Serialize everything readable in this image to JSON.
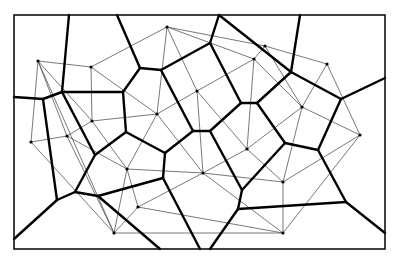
{
  "diagram": {
    "type": "voronoi-delaunay",
    "size": {
      "width": 397,
      "height": 260
    },
    "colors": {
      "background": "#ffffff",
      "frame": "#111111",
      "voronoi": "#000000",
      "delaunay": "#555555",
      "site": "#000000"
    },
    "stroke_widths": {
      "frame": 1.6,
      "voronoi": 2.4,
      "delaunay": 0.8
    },
    "frame": {
      "x": 14,
      "y": 15,
      "w": 371,
      "h": 234
    },
    "sites": [
      [
        38,
        61
      ],
      [
        91,
        67
      ],
      [
        167,
        27
      ],
      [
        197,
        91
      ],
      [
        157,
        114
      ],
      [
        92,
        121
      ],
      [
        31,
        142
      ],
      [
        67,
        136
      ],
      [
        127,
        169
      ],
      [
        138,
        207
      ],
      [
        114,
        233
      ],
      [
        203,
        173
      ],
      [
        247,
        149
      ],
      [
        283,
        182
      ],
      [
        283,
        233
      ],
      [
        360,
        135
      ],
      [
        302,
        107
      ],
      [
        327,
        64
      ],
      [
        265,
        46
      ],
      [
        254,
        59
      ]
    ],
    "delaunay_edges": [
      [
        0,
        6
      ],
      [
        0,
        7
      ],
      [
        6,
        7
      ],
      [
        0,
        1
      ],
      [
        1,
        5
      ],
      [
        5,
        7
      ],
      [
        1,
        4
      ],
      [
        4,
        5
      ],
      [
        1,
        2
      ],
      [
        2,
        4
      ],
      [
        2,
        3
      ],
      [
        2,
        19
      ],
      [
        3,
        19
      ],
      [
        3,
        4
      ],
      [
        3,
        11
      ],
      [
        4,
        11
      ],
      [
        3,
        12
      ],
      [
        11,
        12
      ],
      [
        12,
        19
      ],
      [
        16,
        19
      ],
      [
        18,
        19
      ],
      [
        17,
        18
      ],
      [
        16,
        17
      ],
      [
        15,
        17
      ],
      [
        15,
        16
      ],
      [
        12,
        16
      ],
      [
        13,
        16
      ],
      [
        12,
        13
      ],
      [
        13,
        15
      ],
      [
        14,
        15
      ],
      [
        13,
        14
      ],
      [
        11,
        13
      ],
      [
        11,
        14
      ],
      [
        8,
        11
      ],
      [
        4,
        8
      ],
      [
        5,
        8
      ],
      [
        8,
        9
      ],
      [
        9,
        11
      ],
      [
        9,
        10
      ],
      [
        8,
        10
      ],
      [
        7,
        10
      ],
      [
        6,
        10
      ],
      [
        2,
        18
      ],
      [
        0,
        5
      ],
      [
        0,
        10
      ],
      [
        7,
        8
      ],
      [
        10,
        14
      ],
      [
        16,
        18
      ],
      [
        9,
        14
      ]
    ],
    "voronoi_edges": [
      [
        14,
        97,
        43,
        99
      ],
      [
        43,
        99,
        62,
        92
      ],
      [
        43,
        99,
        57,
        200
      ],
      [
        62,
        92,
        69,
        15
      ],
      [
        62,
        92,
        123,
        92
      ],
      [
        62,
        92,
        95,
        155
      ],
      [
        123,
        92,
        140,
        68
      ],
      [
        123,
        92,
        126,
        132
      ],
      [
        140,
        68,
        117,
        15
      ],
      [
        140,
        68,
        161,
        70
      ],
      [
        161,
        70,
        210,
        43
      ],
      [
        210,
        43,
        219,
        15
      ],
      [
        210,
        43,
        241,
        103
      ],
      [
        161,
        70,
        193,
        131
      ],
      [
        193,
        131,
        210,
        131
      ],
      [
        193,
        131,
        165,
        153
      ],
      [
        210,
        131,
        241,
        103
      ],
      [
        210,
        131,
        242,
        190
      ],
      [
        241,
        103,
        257,
        103
      ],
      [
        257,
        103,
        291,
        72
      ],
      [
        219,
        15,
        291,
        72
      ],
      [
        291,
        72,
        300,
        15
      ],
      [
        291,
        72,
        341,
        99
      ],
      [
        341,
        99,
        385,
        78
      ],
      [
        341,
        99,
        318,
        150
      ],
      [
        257,
        103,
        285,
        143
      ],
      [
        285,
        143,
        318,
        150
      ],
      [
        285,
        143,
        242,
        190
      ],
      [
        318,
        150,
        346,
        202
      ],
      [
        346,
        202,
        385,
        233
      ],
      [
        346,
        202,
        238,
        209
      ],
      [
        242,
        190,
        238,
        209
      ],
      [
        238,
        209,
        210,
        249
      ],
      [
        165,
        153,
        163,
        178
      ],
      [
        165,
        153,
        126,
        132
      ],
      [
        126,
        132,
        95,
        155
      ],
      [
        163,
        178,
        98,
        196
      ],
      [
        163,
        178,
        200,
        249
      ],
      [
        98,
        196,
        160,
        249
      ],
      [
        98,
        196,
        75,
        192
      ],
      [
        75,
        192,
        95,
        155
      ],
      [
        75,
        192,
        57,
        200
      ],
      [
        57,
        200,
        14,
        239
      ]
    ]
  }
}
